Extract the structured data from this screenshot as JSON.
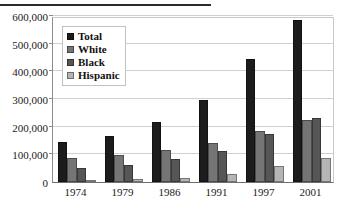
{
  "chart_data": {
    "type": "bar",
    "title": "",
    "xlabel": "",
    "ylabel": "",
    "categories": [
      "1974",
      "1979",
      "1986",
      "1991",
      "1997",
      "2001"
    ],
    "series": [
      {
        "name": "Total",
        "color": "#1c1c1c",
        "values": [
          143000,
          166000,
          217000,
          296000,
          444000,
          585000
        ]
      },
      {
        "name": "White",
        "color": "#757575",
        "values": [
          87000,
          96000,
          114000,
          141000,
          185000,
          224000
        ]
      },
      {
        "name": "Black",
        "color": "#565656",
        "values": [
          51000,
          62000,
          84000,
          111000,
          172000,
          232000
        ]
      },
      {
        "name": "Hispanic",
        "color": "#b5b5b5",
        "values": [
          8000,
          11000,
          16000,
          29000,
          58000,
          88000
        ]
      }
    ],
    "ylim": [
      0,
      600000
    ],
    "ytick_step": 100000,
    "ytick_labels": [
      "0",
      "100,000",
      "200,000",
      "300,000",
      "400,000",
      "500,000",
      "600,000"
    ],
    "ytick_values": [
      0,
      100000,
      200000,
      300000,
      400000,
      500000,
      600000
    ],
    "grid": true,
    "legend_position": "top-left-inside"
  },
  "legend": {
    "items": [
      {
        "label": "Total"
      },
      {
        "label": "White"
      },
      {
        "label": "Black"
      },
      {
        "label": "Hispanic"
      }
    ]
  }
}
